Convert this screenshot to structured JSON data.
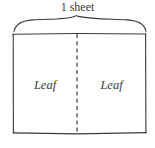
{
  "figure": {
    "background_color": "#ffffff",
    "ink_color": "#3a3a3a",
    "brace": {
      "name": "sheet-brace",
      "orientation": "horizontal",
      "direction": "up",
      "spans_label": "1 sheet"
    },
    "sheet_label": "1 sheet",
    "leaf_left_label": "Leaf",
    "leaf_right_label": "Leaf",
    "divider": {
      "style": "dashed",
      "orientation": "vertical"
    },
    "rectangle": {
      "style": "solid",
      "description": "sheet outline"
    }
  }
}
